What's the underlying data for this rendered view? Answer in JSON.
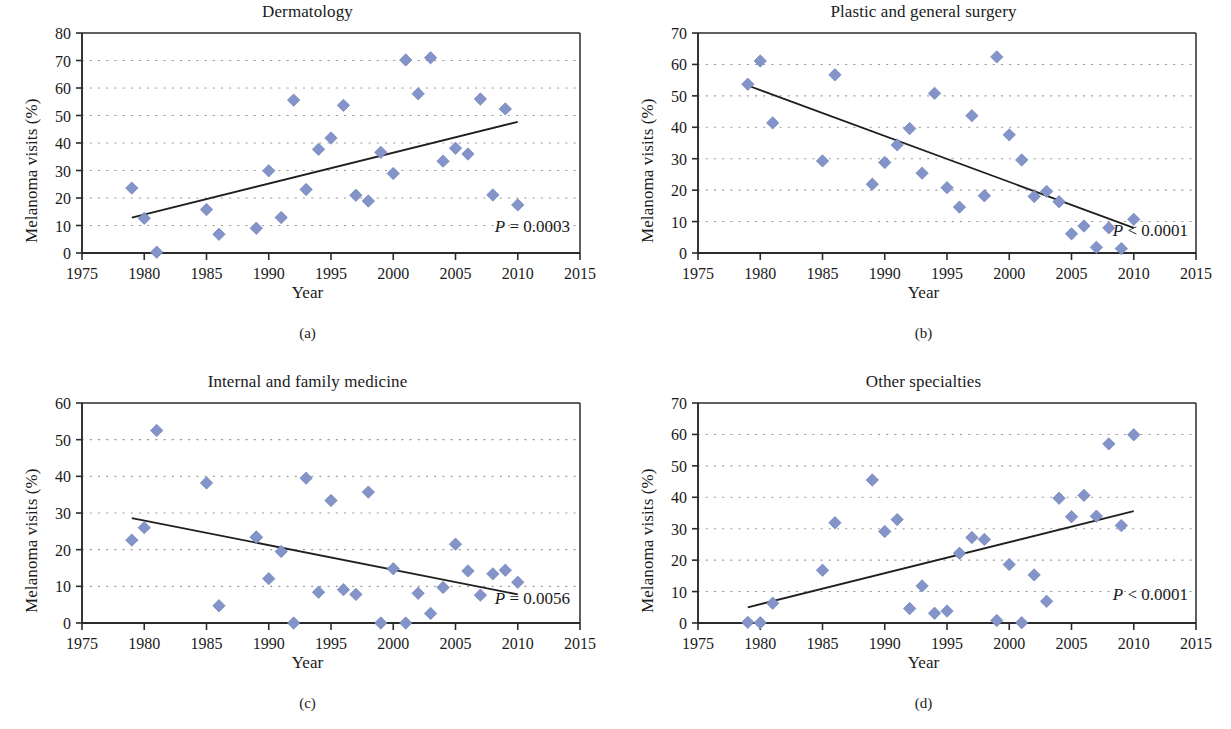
{
  "figure": {
    "marker_color": "#8494c8",
    "marker_stroke": "#6f82bb",
    "axis_color": "#2b2b2b",
    "grid_color": "#9a9a9a",
    "trend_color": "#1f1f1f"
  },
  "panels": [
    {
      "id": "a",
      "subcaption": "(a)",
      "chart_data": {
        "type": "scatter",
        "title": "Dermatology",
        "xlabel": "Year",
        "ylabel": "Melanoma visits (%)",
        "xlim": [
          1975,
          2015
        ],
        "ylim": [
          0,
          80
        ],
        "xticks": [
          1975,
          1980,
          1985,
          1990,
          1995,
          2000,
          2005,
          2010,
          2015
        ],
        "yticks": [
          0,
          10,
          20,
          30,
          40,
          50,
          60,
          70,
          80
        ],
        "grid": "horizontal-dotted",
        "annotation": "P = 0.0003",
        "annotation_prefix": "P",
        "annotation_rest": " = 0.0003",
        "x": [
          1979,
          1980,
          1981,
          1985,
          1986,
          1989,
          1990,
          1991,
          1992,
          1993,
          1994,
          1995,
          1996,
          1997,
          1998,
          1999,
          2000,
          2001,
          2002,
          2003,
          2004,
          2005,
          2006,
          2007,
          2008,
          2009,
          2010
        ],
        "y": [
          23.6,
          12.6,
          0.3,
          15.8,
          6.8,
          9.0,
          29.9,
          12.9,
          55.6,
          23.1,
          37.7,
          41.8,
          53.7,
          21.0,
          18.9,
          36.6,
          28.9,
          70.2,
          57.9,
          71.0,
          33.4,
          38.1,
          36.0,
          56.0,
          21.1,
          52.4,
          17.5
        ],
        "trendline": {
          "x1": 1979,
          "y1": 12.9,
          "x2": 2010,
          "y2": 47.7
        }
      }
    },
    {
      "id": "b",
      "subcaption": "(b)",
      "chart_data": {
        "type": "scatter",
        "title": "Plastic and general surgery",
        "xlabel": "Year",
        "ylabel": "Melanoma visits (%)",
        "xlim": [
          1975,
          2015
        ],
        "ylim": [
          0,
          70
        ],
        "xticks": [
          1975,
          1980,
          1985,
          1990,
          1995,
          2000,
          2005,
          2010,
          2015
        ],
        "yticks": [
          0,
          10,
          20,
          30,
          40,
          50,
          60,
          70
        ],
        "grid": "horizontal-dotted",
        "annotation": "P < 0.0001",
        "annotation_prefix": "P",
        "annotation_rest": " < 0.0001",
        "x": [
          1979,
          1980,
          1981,
          1985,
          1986,
          1989,
          1990,
          1991,
          1992,
          1993,
          1994,
          1995,
          1996,
          1997,
          1998,
          1999,
          2000,
          2001,
          2002,
          2003,
          2004,
          2005,
          2006,
          2007,
          2008,
          2009,
          2010
        ],
        "y": [
          53.7,
          61.1,
          41.4,
          29.3,
          56.7,
          21.9,
          28.8,
          34.4,
          39.6,
          25.4,
          50.8,
          20.8,
          14.6,
          43.7,
          18.2,
          62.4,
          37.6,
          29.6,
          18.0,
          19.6,
          16.3,
          6.1,
          8.6,
          1.8,
          8.0,
          1.4,
          10.7
        ],
        "trendline": {
          "x1": 1979,
          "y1": 53.3,
          "x2": 2010,
          "y2": 8.0
        }
      }
    },
    {
      "id": "c",
      "subcaption": "(c)",
      "chart_data": {
        "type": "scatter",
        "title": "Internal and family medicine",
        "xlabel": "Year",
        "ylabel": "Melanoma visits (%)",
        "xlim": [
          1975,
          2015
        ],
        "ylim": [
          0,
          60
        ],
        "xticks": [
          1975,
          1980,
          1985,
          1990,
          1995,
          2000,
          2005,
          2010,
          2015
        ],
        "yticks": [
          0,
          10,
          20,
          30,
          40,
          50,
          60
        ],
        "grid": "horizontal-dotted",
        "annotation": "P = 0.0056",
        "annotation_prefix": "P",
        "annotation_rest": " = 0.0056",
        "x": [
          1979,
          1980,
          1981,
          1985,
          1986,
          1989,
          1989,
          1990,
          1991,
          1992,
          1993,
          1994,
          1995,
          1996,
          1997,
          1998,
          1999,
          2000,
          2001,
          2002,
          2003,
          2004,
          2005,
          2006,
          2007,
          2008,
          2009,
          2010
        ],
        "y": [
          22.6,
          26.0,
          52.5,
          38.2,
          4.7,
          23.4,
          23.4,
          12.1,
          19.5,
          0.0,
          39.5,
          8.4,
          33.4,
          9.1,
          7.8,
          35.7,
          0.0,
          14.8,
          0.0,
          8.1,
          2.6,
          9.7,
          21.5,
          14.2,
          7.6,
          13.4,
          14.4,
          11.1
        ],
        "trendline": {
          "x1": 1979,
          "y1": 28.6,
          "x2": 2010,
          "y2": 7.8
        }
      }
    },
    {
      "id": "d",
      "subcaption": "(d)",
      "chart_data": {
        "type": "scatter",
        "title": "Other specialties",
        "xlabel": "Year",
        "ylabel": "Melanoma visits (%)",
        "xlim": [
          1975,
          2015
        ],
        "ylim": [
          0,
          70
        ],
        "xticks": [
          1975,
          1980,
          1985,
          1990,
          1995,
          2000,
          2005,
          2010,
          2015
        ],
        "yticks": [
          0,
          10,
          20,
          30,
          40,
          50,
          60,
          70
        ],
        "grid": "horizontal-dotted",
        "annotation": "P < 0.0001",
        "annotation_prefix": "P",
        "annotation_rest": " < 0.0001",
        "x": [
          1979,
          1980,
          1981,
          1985,
          1986,
          1989,
          1990,
          1991,
          1992,
          1993,
          1994,
          1995,
          1996,
          1997,
          1998,
          1999,
          2000,
          2001,
          2002,
          2003,
          2004,
          2005,
          2006,
          2007,
          2008,
          2009,
          2010
        ],
        "y": [
          0.2,
          0.1,
          6.3,
          16.8,
          31.9,
          45.5,
          29.1,
          32.9,
          4.6,
          11.8,
          3.1,
          3.8,
          22.2,
          27.2,
          26.6,
          0.8,
          18.6,
          0.1,
          15.3,
          6.9,
          39.7,
          33.8,
          40.6,
          34.0,
          57.0,
          31.0,
          59.9
        ],
        "trendline": {
          "x1": 1979,
          "y1": 5.0,
          "x2": 2010,
          "y2": 35.6
        }
      }
    }
  ]
}
